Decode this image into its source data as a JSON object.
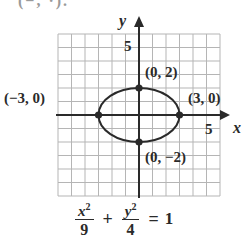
{
  "header": {
    "clipped_text": "(−, ·)."
  },
  "chart_data": {
    "type": "line",
    "title": "",
    "xlabel": "x",
    "ylabel": "y",
    "xlim": [
      -6,
      6
    ],
    "ylim": [
      -6,
      6
    ],
    "grid": true,
    "tick_labels": {
      "x": [
        "5"
      ],
      "y": [
        "5"
      ]
    },
    "series": [
      {
        "name": "ellipse",
        "equation": "x^2/9 + y^2/4 = 1",
        "a": 3,
        "b": 2,
        "center": [
          0,
          0
        ]
      }
    ],
    "points": [
      {
        "x": 0,
        "y": 2,
        "label": "(0, 2)"
      },
      {
        "x": -3,
        "y": 0,
        "label": "(−3, 0)"
      },
      {
        "x": 3,
        "y": 0,
        "label": "(3, 0)"
      },
      {
        "x": 0,
        "y": -2,
        "label": "(0, −2)"
      }
    ],
    "annotations": [
      "x²/9 + y²/4 = 1"
    ],
    "legend": null
  },
  "equation": {
    "term1_num": "x",
    "term1_exp": "2",
    "term1_den": "9",
    "plus": "+",
    "term2_num": "y",
    "term2_exp": "2",
    "term2_den": "4",
    "equals": "=",
    "rhs": "1"
  },
  "axes": {
    "x_label": "x",
    "y_label": "y",
    "x_tick": "5",
    "y_tick": "5"
  }
}
